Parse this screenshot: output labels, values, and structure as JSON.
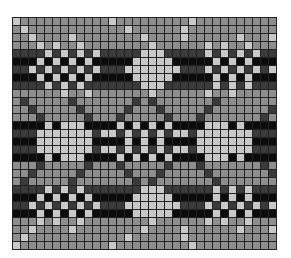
{
  "chart": {
    "title": "",
    "cols": 33,
    "rows_count": 29,
    "palette": {
      "L": "#c8c8c8",
      "M": "#8e8e8e",
      "D": "#3a3a3a",
      "K": "#0c0c0c"
    },
    "rows": [
      "LMMMMMMMMMMMLMMMMMMMMMLMMMMMMMMMMML",
      "MLMMMMMMMMMMMMLMMMMMMLMMMMMMMMMMMLM",
      "MMLMMMMLMMMMMMMMLMMMMLMMMMMMLMMMLMM",
      "MMMLMLMMLMMMMMMMMLMMMMMMLMLMMLMMMMM",
      "DDDDLDLDLDLDDDDDLLLDDDDDLDLDLDLDDDD",
      "KKKLKLKLKLKKKKKLLLLLKKKKKLKLKLKKKKK",
      "DDLDLDLDLDLDDDLLLLLLLDDDLDLDLDLDLDD",
      "KKKLKLKLKLKKKKKLLLLLKKKKKLKLKLKKKKK",
      "DDDDLDLDLDDDDDDDLLLDDDDDDLDLDLDDDDD",
      "MMMMMMLMMLMMMMMMMLMMMMMMLMMLMMMMMMM",
      "MDMMMMMDMMMMMMMDMDMMMMMMMDMMMMMMMDM",
      "MMDMMMMMDMMMMMDMMMDMMMMMDMMMMMMMDMM",
      "MMMDMMMMMDMMMDMMMMMDMMMDMMMMMMMDMMM",
      "KKKKLKLLLKKKKLKLKLKLKKKKLLLKLKKKKKK",
      "DDDLLLLLLLDLLDLDLDLDLLDLLLLLLLDDDDD",
      "KKKLLLLLLLKKKKLKLKLKKKKLLLLLLLKKKKK",
      "DDDLLLLLLLDLLDLDLDLDLLDLLLLLLLDDDDD",
      "KKKKLKLLLKKKKLKLKLKLKKKKLLLKLKKKKKK",
      "MMMDMMMMMDMMMDMMMMMDMMMDMMMMMMMDMMM",
      "MMDMMMMMDMMMMMDMMMDMMMMMDMMMMMMMDMM",
      "MDMMMMMDMMMMMMMDMDMMMMMMMDMMMMMMMDM",
      "DDDDLDLDLDDDDDDDLLLDDDDDDLDLDLDDDDD",
      "KKKLKLKLKLKKKKKLLLLLKKKKKLKLKLKKKKK",
      "DDLDLDLDLDLDDDLLLLLLLDDDLDLDLDLDLDD",
      "KKKLKLKLKLKKKKKLLLLLKKKKKLKLKLKKKKK",
      "MMMLMLMMLMMMMMMMMLMMMMMMLMLMMLMMMMM",
      "MMLMMMMLMMMMMMMMLMMMMLMMMMMMLMMMLMM",
      "MLMMMMMMMMMMMMLMMMMMMLMMMMMMMMMMMLM",
      "LMMMMMMMMMMMLMMMMMMMMMLMMMMMMMMMMML"
    ]
  }
}
